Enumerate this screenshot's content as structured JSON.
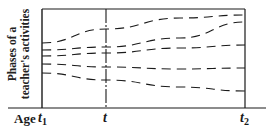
{
  "diagram": {
    "y_axis_label_line1": "Phases of a",
    "y_axis_label_line2": "teacher's activities",
    "x_axis_label": "Age",
    "ticks": [
      {
        "base": "t",
        "sub": "1"
      },
      {
        "base": "t",
        "sub": ""
      },
      {
        "base": "t",
        "sub": "2"
      }
    ],
    "line_color": "#1a1a1a",
    "background": "#ffffff",
    "phase_lines": [
      {
        "name": "phase-1",
        "points": [
          [
            42,
            43
          ],
          [
            106,
            29
          ],
          [
            180,
            18
          ],
          [
            245,
            15
          ]
        ]
      },
      {
        "name": "phase-2",
        "points": [
          [
            42,
            50
          ],
          [
            106,
            47
          ],
          [
            180,
            38
          ],
          [
            245,
            22
          ]
        ]
      },
      {
        "name": "phase-3",
        "points": [
          [
            42,
            56
          ],
          [
            106,
            53
          ],
          [
            180,
            48
          ],
          [
            245,
            45
          ]
        ]
      },
      {
        "name": "phase-4",
        "points": [
          [
            42,
            64
          ],
          [
            106,
            67
          ],
          [
            180,
            69
          ],
          [
            245,
            68
          ]
        ]
      },
      {
        "name": "phase-5",
        "points": [
          [
            42,
            73
          ],
          [
            106,
            80
          ],
          [
            180,
            87
          ],
          [
            245,
            91
          ]
        ]
      }
    ]
  }
}
